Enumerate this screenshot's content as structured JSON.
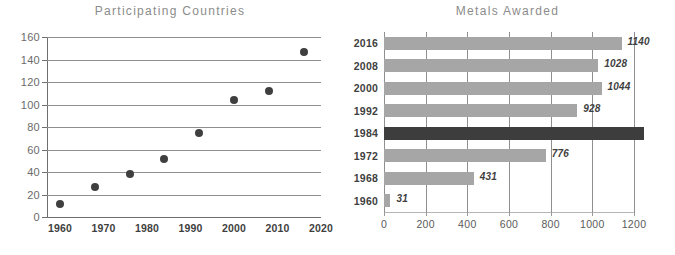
{
  "chart_data": [
    {
      "type": "scatter",
      "title": "Participating Countries",
      "xlabel": "",
      "ylabel": "",
      "xlim": [
        1957,
        2020
      ],
      "ylim": [
        0,
        160
      ],
      "grid": "horizontal",
      "legend": "none",
      "x_ticks": [
        "1960",
        "1970",
        "1980",
        "1990",
        "2000",
        "2010",
        "2020"
      ],
      "y_ticks": [
        "0",
        "20",
        "40",
        "60",
        "80",
        "100",
        "120",
        "140",
        "160"
      ],
      "x": [
        1960,
        1968,
        1976,
        1984,
        1992,
        2000,
        2008,
        2016
      ],
      "values": [
        12,
        27,
        38,
        52,
        75,
        104,
        112,
        147
      ],
      "marker_color": "#3f3f3f"
    },
    {
      "type": "bar",
      "orientation": "horizontal",
      "title": "Metals Awarded",
      "xlabel": "",
      "ylabel": "",
      "xlim": [
        0,
        1200
      ],
      "grid": "vertical",
      "legend": "none",
      "x_ticks": [
        "0",
        "200",
        "400",
        "600",
        "800",
        "1000",
        "1200"
      ],
      "categories": [
        "2016",
        "2008",
        "2000",
        "1992",
        "1984",
        "1972",
        "1968",
        "1960"
      ],
      "values": [
        1140,
        1028,
        1044,
        928,
        1250,
        776,
        431,
        31
      ],
      "data_labels": [
        "1140",
        "1028",
        "1044",
        "928",
        "",
        "776",
        "431",
        "31"
      ],
      "highlight_category": "1984",
      "bar_color": "#a6a6a6",
      "highlight_color": "#3d3d3d"
    }
  ],
  "left_chart": {
    "title": "Participating Countries"
  },
  "right_chart": {
    "title": "Metals Awarded"
  }
}
